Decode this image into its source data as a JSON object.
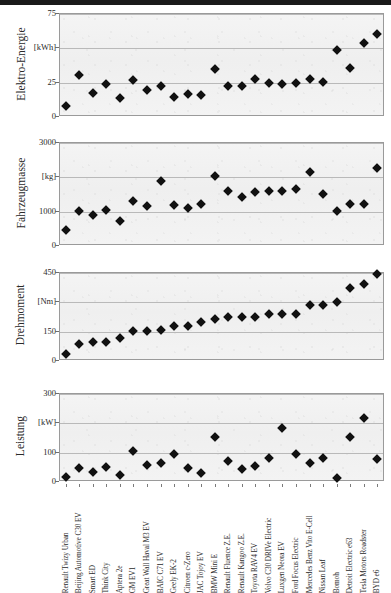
{
  "chart_data": {
    "type": "scatter",
    "title": "",
    "xlabel": "",
    "categories": [
      "Renault Twizy Urban",
      "Beijing Automotive C30 EV",
      "Smart ED",
      "Think City",
      "Aptera 2e",
      "GM EV1",
      "Great Wall Haval M3 EV",
      "BAIC C71 EV",
      "Geely EK-2",
      "Citroen c-Zero",
      "JAC Tojoy EV",
      "BMW Mini E",
      "Renault Fluence Z.E.",
      "Renault Kangoo Z.E.",
      "Toyota RAV4 EV",
      "Volvo C30 DRIVe Electric",
      "Luxgen Neora EV",
      "Ford Focus Electric",
      "Mercedes Benz Vito E-Cell",
      "Nissan Leaf",
      "Bomoh",
      "Detroit Electric e63",
      "Tesla Motors Roadster",
      "BYD e6"
    ],
    "panels": [
      {
        "id": "elektro-energie",
        "ylabel": "Elektro-Energie",
        "unit": "[kWh]",
        "ylim": [
          0,
          75
        ],
        "yticks": [
          0,
          25,
          50,
          75
        ],
        "ytick_labels": [
          "0",
          "25",
          "[kWh]",
          "75"
        ],
        "grid": true,
        "values": [
          7,
          30,
          17,
          23,
          13,
          26,
          19,
          22,
          14,
          16,
          15,
          34,
          22,
          22,
          27,
          24,
          23,
          24,
          27,
          25,
          48,
          35,
          53,
          60
        ]
      },
      {
        "id": "fahrzeugmasse",
        "ylabel": "Fahrzeugmasse",
        "unit": "[kg]",
        "ylim": [
          0,
          3000
        ],
        "yticks": [
          0,
          1000,
          2000,
          3000
        ],
        "ytick_labels": [
          "0",
          "1000",
          "[kg]",
          "3000"
        ],
        "grid": true,
        "values": [
          450,
          1000,
          870,
          1030,
          690,
          1270,
          1150,
          1870,
          1160,
          1080,
          1180,
          2000,
          1580,
          1400,
          1540,
          1570,
          1560,
          1620,
          2120,
          1500,
          980,
          1200,
          1200,
          2250
        ]
      },
      {
        "id": "drehmoment",
        "ylabel": "Drehmoment",
        "unit": "[Nm]",
        "ylim": [
          0,
          450
        ],
        "yticks": [
          0,
          150,
          300,
          450
        ],
        "ytick_labels": [
          "0",
          "150",
          "[Nm]",
          "450"
        ],
        "grid": true,
        "values": [
          33,
          80,
          90,
          90,
          110,
          148,
          148,
          155,
          172,
          176,
          196,
          212,
          222,
          222,
          222,
          235,
          237,
          237,
          280,
          282,
          296,
          370,
          390,
          440
        ]
      },
      {
        "id": "leistung",
        "ylabel": "Leistung",
        "unit": "[kW]",
        "ylim": [
          0,
          300
        ],
        "yticks": [
          0,
          100,
          200,
          300
        ],
        "ytick_labels": [
          "0",
          "100",
          "[kW]",
          "300"
        ],
        "grid": true,
        "values": [
          15,
          45,
          30,
          47,
          21,
          102,
          55,
          62,
          92,
          45,
          26,
          150,
          68,
          42,
          50,
          80,
          180,
          93,
          60,
          80,
          10,
          150,
          215,
          75
        ]
      }
    ]
  }
}
